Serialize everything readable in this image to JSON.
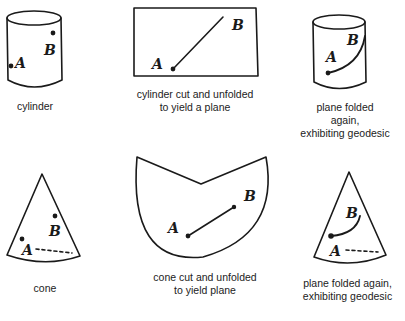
{
  "panels": {
    "cylinder": {
      "caption": "cylinder",
      "point_a": "A",
      "point_b": "B"
    },
    "cylinder_unfolded": {
      "caption": "cylinder cut and unfolded\nto yield a plane",
      "point_a": "A",
      "point_b": "B"
    },
    "cylinder_refolded": {
      "caption": "plane folded\nagain,\nexhibiting geodesic",
      "point_a": "A",
      "point_b": "B"
    },
    "cone": {
      "caption": "cone",
      "point_a": "A",
      "point_b": "B"
    },
    "cone_unfolded": {
      "caption": "cone cut and unfolded\nto yield plane",
      "point_a": "A",
      "point_b": "B"
    },
    "cone_refolded": {
      "caption": "plane folded again,\nexhibiting geodesic",
      "point_a": "A",
      "point_b": "B"
    }
  },
  "colors": {
    "ink": "#1a1a1a",
    "background": "#ffffff"
  }
}
